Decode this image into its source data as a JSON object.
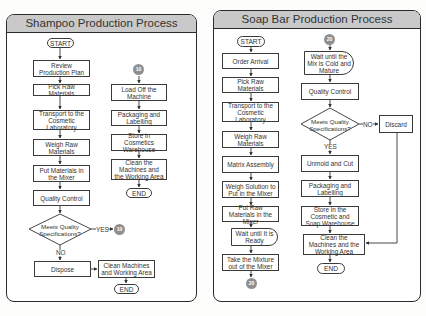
{
  "shampoo": {
    "title": "Shampoo Production Process",
    "start": "START",
    "left_column": [
      "Review Production Plan",
      "Pick Raw Materials",
      "Transport to the Cosmetic Laboratory",
      "Weigh Raw Materials",
      "Put Materials in the Mixer",
      "Quality Control"
    ],
    "decision": "Meets Quality Specifications?",
    "yes_label": "YES",
    "no_label": "NO",
    "connector": "10",
    "dispose": "Dispose",
    "clean_short": "Clean Machines and Working Area",
    "end": "END",
    "right_column": [
      "Load Off the Machine",
      "Packaging and Labelling",
      "Store in Cosmetics Warehouse",
      "Clean the Machines and the Working Area"
    ],
    "right_end": "END"
  },
  "soap": {
    "title": "Soap Bar Production Process",
    "start": "START",
    "left_column": [
      "Order Arrival",
      "Pick Raw Materials",
      "Transport to the Cosmetic Laboratory",
      "Weigh Raw Materials",
      "Matrix Assembly",
      "Weigh Solution to Put in the Mixer",
      "Put Raw Materials in the Mixer"
    ],
    "wait_ready": "Wait until It is Ready",
    "take_mixture": "Take the Mixture out of the Mixer",
    "connector": "20",
    "wait_cold": "Wait until the Mix is Cold and Mature",
    "quality_control": "Quality Control",
    "decision": "Meets Quality Specifications?",
    "no_label": "NO",
    "yes_label": "YES",
    "discard": "Discard",
    "right_column": [
      "Unmold and Cut",
      "Packaging and Labelling",
      "Store in the Cosmetic and Soap Warehouse",
      "Clean the Machines and the Working Area"
    ],
    "end": "END"
  }
}
